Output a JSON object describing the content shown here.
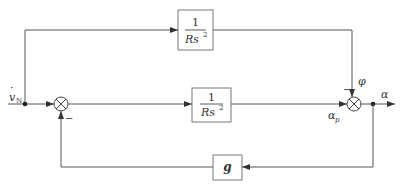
{
  "diagram": {
    "type": "block-diagram",
    "input": {
      "symbol": "v",
      "subscript": "N",
      "dot": "·"
    },
    "output": {
      "label": "α"
    },
    "blocks": [
      {
        "id": "top-block",
        "numerator": "1",
        "denominator": "Rs",
        "exponent": "2"
      },
      {
        "id": "main-block",
        "numerator": "1",
        "denominator": "Rs",
        "exponent": "2"
      },
      {
        "id": "feedback-block",
        "label": "g"
      }
    ],
    "summing_junctions": [
      {
        "id": "sum-1",
        "feedback_sign": "−"
      },
      {
        "id": "sum-2",
        "top_sign": "−",
        "top_signal": "φ"
      }
    ],
    "signals": {
      "alpha_p": "α",
      "alpha_p_sub": "p",
      "phi": "φ"
    },
    "colors": {
      "line": "#555555",
      "box_border": "#777777",
      "text": "#333333"
    }
  }
}
